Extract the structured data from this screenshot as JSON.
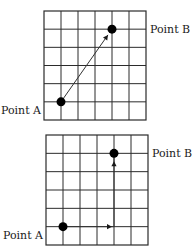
{
  "diagrams": [
    {
      "id": "diagonal",
      "grid": {
        "cols": 6,
        "rows": 6
      },
      "point_a": {
        "label": "Point A",
        "col": 1,
        "row_from_bottom": 1
      },
      "point_b": {
        "label": "Point B",
        "col": 4,
        "row_from_bottom": 5
      },
      "path": "direct",
      "description": "Straight diagonal arrow from Point A to Point B"
    },
    {
      "id": "stepwise",
      "grid": {
        "cols": 6,
        "rows": 6
      },
      "point_a": {
        "label": "Point A",
        "col": 1,
        "row_from_bottom": 1
      },
      "point_b": {
        "label": "Point B",
        "col": 4,
        "row_from_bottom": 5
      },
      "path": "horizontal-then-vertical",
      "description": "Arrow right along grid, then up to Point B"
    }
  ],
  "colors": {
    "line": "#2b2b2b",
    "dot": "#000000",
    "background": "#ffffff"
  }
}
